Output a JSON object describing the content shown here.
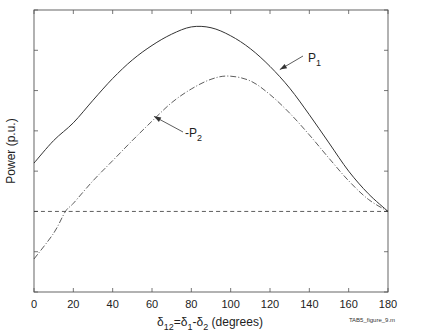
{
  "chart_data": {
    "type": "line",
    "title": "",
    "xlabel": "δ12=δ1-δ2 (degrees)",
    "xlabel_parts": {
      "d1": "δ",
      "s1": "12",
      "eq": "=δ",
      "s2": "1",
      "minus": "-δ",
      "s3": "2",
      "rest": " (degrees)"
    },
    "ylabel": "Power (p.u.)",
    "xlim": [
      0,
      180
    ],
    "ylim": [
      -1.0,
      2.5
    ],
    "xticks": [
      0,
      20,
      40,
      60,
      80,
      100,
      120,
      140,
      160,
      180
    ],
    "xtick_labels": [
      "0",
      "20",
      "40",
      "60",
      "80",
      "100",
      "120",
      "140",
      "160",
      "180"
    ],
    "yticks": [
      -1.0,
      -0.5,
      0,
      0.5,
      1.0,
      1.5,
      2.0,
      2.5
    ],
    "ytick_labels_shown": false,
    "grid": false,
    "series": [
      {
        "name": "P1",
        "style": "solid",
        "x": [
          0,
          10,
          20,
          30,
          40,
          50,
          60,
          70,
          80,
          90,
          100,
          110,
          120,
          130,
          140,
          150,
          160,
          170,
          180
        ],
        "y": [
          0.6,
          0.88,
          1.1,
          1.38,
          1.65,
          1.88,
          2.06,
          2.2,
          2.29,
          2.28,
          2.18,
          2.02,
          1.8,
          1.53,
          1.2,
          0.85,
          0.5,
          0.22,
          0.0
        ]
      },
      {
        "name": "-P2",
        "style": "dashdot",
        "x": [
          0,
          10,
          16,
          20,
          30,
          40,
          50,
          60,
          70,
          80,
          90,
          99,
          110,
          120,
          130,
          140,
          150,
          160,
          170,
          180
        ],
        "y": [
          -0.59,
          -0.27,
          0.0,
          0.1,
          0.38,
          0.63,
          0.88,
          1.12,
          1.35,
          1.52,
          1.64,
          1.68,
          1.62,
          1.45,
          1.22,
          0.95,
          0.66,
          0.38,
          0.15,
          0.0
        ]
      },
      {
        "name": "zero-line",
        "style": "dashed",
        "x": [
          0,
          180
        ],
        "y": [
          0,
          0
        ]
      }
    ],
    "annotations": [
      {
        "id": "p1",
        "text": "P",
        "sub": "1",
        "target_x": 125,
        "target_y": 1.76
      },
      {
        "id": "p2",
        "text": "-P",
        "sub": "2",
        "target_x": 61,
        "target_y": 1.18
      }
    ],
    "footer_text": "TAB5_figure_9.m"
  }
}
